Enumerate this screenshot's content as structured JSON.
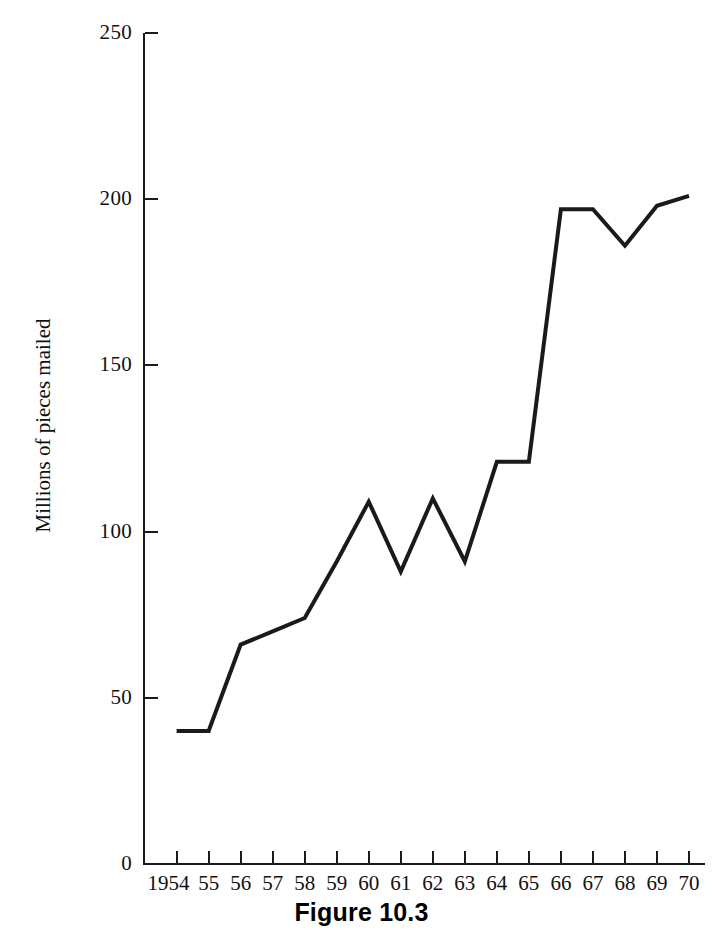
{
  "figure": {
    "caption": "Figure 10.3"
  },
  "chart_data": {
    "type": "line",
    "title": "",
    "subtitle": "",
    "xlabel": "",
    "ylabel": "Millions of pieces mailed",
    "categories": [
      "1954",
      "55",
      "56",
      "57",
      "58",
      "59",
      "60",
      "61",
      "62",
      "63",
      "64",
      "65",
      "66",
      "67",
      "68",
      "69",
      "70"
    ],
    "x_values": [
      1954,
      1955,
      1956,
      1957,
      1958,
      1959,
      1960,
      1961,
      1962,
      1963,
      1964,
      1965,
      1966,
      1967,
      1968,
      1969,
      1970
    ],
    "values": [
      40,
      40,
      66,
      70,
      74,
      91,
      109,
      88,
      110,
      91,
      121,
      121,
      197,
      197,
      186,
      198,
      201
    ],
    "series": [
      {
        "name": "Millions of pieces mailed",
        "values": [
          40,
          40,
          66,
          70,
          74,
          91,
          109,
          88,
          110,
          91,
          121,
          121,
          197,
          197,
          186,
          198,
          201
        ],
        "color": "#1a1a1a"
      }
    ],
    "ylim": [
      0,
      250
    ],
    "yticks": [
      0,
      50,
      100,
      150,
      200,
      250
    ],
    "ytick_labels": [
      "0",
      "50",
      "100",
      "150",
      "200",
      "250"
    ],
    "xtick_labels": [
      "1954",
      "55",
      "56",
      "57",
      "58",
      "59",
      "60",
      "61",
      "62",
      "63",
      "64",
      "65",
      "66",
      "67",
      "68",
      "69",
      "70"
    ],
    "grid": false,
    "legend": false,
    "legend_position": "none",
    "line_color": "#1a1a1a",
    "line_width": 4,
    "markers": false,
    "background": "#ffffff",
    "axis_color": "#1a1a1a"
  }
}
